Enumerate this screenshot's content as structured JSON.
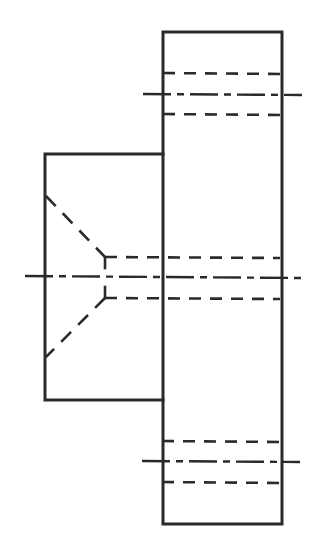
{
  "drawing": {
    "type": "orthographic-section-view",
    "colors": {
      "line": "#2a2a2a",
      "background": "#ffffff"
    },
    "flange": {
      "x": 163,
      "y": 32,
      "w": 119,
      "h": 492
    },
    "hub": {
      "x": 45,
      "y": 154,
      "w": 118,
      "h": 246
    },
    "bolt_holes": [
      {
        "center_y": 94,
        "top_y": 73,
        "bottom_y": 114
      },
      {
        "center_y": 462,
        "top_y": 441,
        "bottom_y": 482
      }
    ],
    "bore": {
      "center_y": 277,
      "top_y": 257,
      "bottom_y": 298,
      "drill_point_x": 105
    }
  }
}
